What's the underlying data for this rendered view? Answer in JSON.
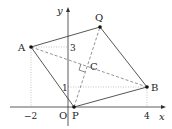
{
  "diagram": {
    "type": "coordinate-geometry",
    "axes": {
      "x_label": "x",
      "y_label": "y",
      "origin_label": "O",
      "x_ticks": [
        {
          "value": -2,
          "label": "−2"
        },
        {
          "value": 4,
          "label": "4"
        }
      ],
      "y_ticks": [
        {
          "value": 1,
          "label": "1"
        },
        {
          "value": 3,
          "label": "3"
        }
      ]
    },
    "points": {
      "A": {
        "label": "A",
        "coords": [
          -2,
          3
        ]
      },
      "B": {
        "label": "B",
        "coords": [
          4,
          1
        ]
      },
      "P": {
        "label": "P",
        "coords": [
          0.3,
          0
        ]
      },
      "Q": {
        "label": "Q",
        "coords": [
          1.6,
          4
        ]
      },
      "C": {
        "label": "C"
      }
    },
    "solid_segments": [
      "A-Q",
      "Q-B",
      "B-P",
      "P-A"
    ],
    "dashed_segments": [
      "A-B",
      "P-Q"
    ],
    "dotted_guides": [
      "A to x=-2",
      "A to y=3",
      "B to x=4",
      "B to y=1"
    ],
    "right_angle_at": "C",
    "colors": {
      "line": "#333333",
      "guide": "#999999",
      "text": "#222222"
    }
  }
}
